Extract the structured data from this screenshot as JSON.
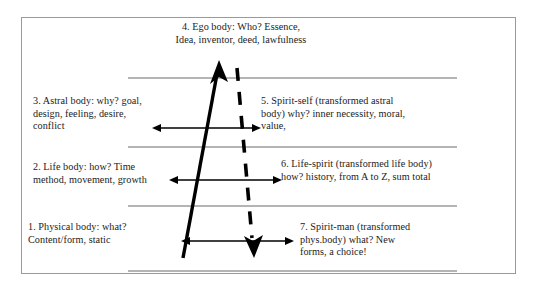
{
  "figure": {
    "colors": {
      "frame": "#9a9a9a",
      "rule": "#6b6b6b",
      "arrow": "#000000",
      "text": "#1b1b1b",
      "background": "#ffffff"
    },
    "blocks": [
      {
        "id": "block-1",
        "label": "physical-body",
        "text": "1. Physical body: what?\nContent/form, static"
      },
      {
        "id": "block-2",
        "label": "life-body",
        "text": "2. Life body: how? Time\nmethod, movement, growth"
      },
      {
        "id": "block-3",
        "label": "astral-body",
        "text": "3. Astral body: why? goal,\ndesign, feeling, desire,\nconflict"
      },
      {
        "id": "block-4",
        "label": "ego-body",
        "text": "4. Ego body: Who? Essence,\nIdea, inventor, deed, lawfulness"
      },
      {
        "id": "block-5",
        "label": "spirit-self",
        "text": "5. Spirit-self (transformed astral\nbody) why? inner necessity, moral,\nvalue,"
      },
      {
        "id": "block-6",
        "label": "life-spirit",
        "text": "6.  Life-spirit (transformed life body)\nhow? history, from A to Z, sum total"
      },
      {
        "id": "block-7",
        "label": "spirit-man",
        "text": "7.  Spirit-man (transformed\nphys.body) what? New\nforms, a choice!"
      }
    ],
    "rules": [
      {
        "name": "divider-rule-top",
        "y": 78,
        "x1": 128,
        "x2": 457
      },
      {
        "name": "divider-rule-upper-middle",
        "y": 147,
        "x1": 128,
        "x2": 457
      },
      {
        "name": "divider-rule-lower-middle",
        "y": 206,
        "x1": 128,
        "x2": 457
      },
      {
        "name": "divider-rule-bottom",
        "y": 271,
        "x1": 128,
        "x2": 457
      }
    ],
    "horizontal_arrows": [
      {
        "name": "double-arrow-astral-spirit-self",
        "y": 128,
        "x1": 161,
        "x2": 252
      },
      {
        "name": "double-arrow-life-life-spirit",
        "y": 180,
        "x1": 178,
        "x2": 273
      },
      {
        "name": "double-arrow-physical-spirit-man",
        "y": 241,
        "x1": 190,
        "x2": 285
      }
    ],
    "diagonals": [
      {
        "name": "ascending-solid-arrow",
        "style": "solid",
        "direction": "up",
        "x1": 183,
        "y1": 258,
        "x2": 219,
        "y2": 64
      },
      {
        "name": "descending-dashed-arrow",
        "style": "dashed",
        "direction": "down",
        "x1": 238,
        "y1": 70,
        "x2": 254,
        "y2": 250
      }
    ]
  }
}
